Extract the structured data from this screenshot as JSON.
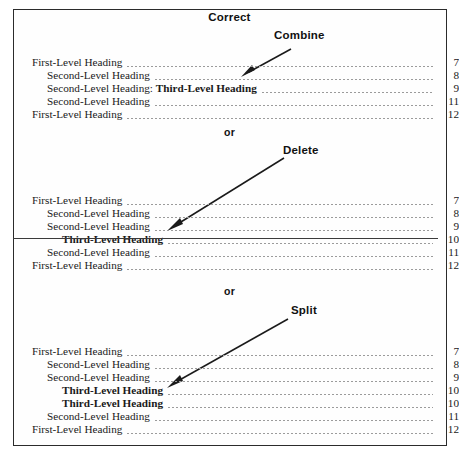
{
  "figure": {
    "caption_top": "Correct",
    "separator_label": "or",
    "border_color": "#2b2b2b"
  },
  "page_label_column_header": "",
  "blocks": [
    {
      "id": "combine",
      "action_label": "Combine",
      "rows": [
        {
          "level": 1,
          "title": "First-Level Heading",
          "page": "7",
          "bold": false,
          "struck": false
        },
        {
          "level": 2,
          "title": "Second-Level Heading",
          "page": "8",
          "bold": false,
          "struck": false
        },
        {
          "level": 2,
          "title": "Second-Level Heading: ",
          "title_bold_suffix": "Third-Level Heading",
          "page": "9",
          "bold": false,
          "struck": false
        },
        {
          "level": 2,
          "title": "Second-Level Heading",
          "page": "11",
          "bold": false,
          "struck": false
        },
        {
          "level": 1,
          "title": "First-Level Heading",
          "page": "12",
          "bold": false,
          "struck": false
        }
      ]
    },
    {
      "id": "delete",
      "action_label": "Delete",
      "rows": [
        {
          "level": 1,
          "title": "First-Level Heading",
          "page": "7",
          "bold": false,
          "struck": false
        },
        {
          "level": 2,
          "title": "Second-Level Heading",
          "page": "8",
          "bold": false,
          "struck": false
        },
        {
          "level": 2,
          "title": "Second-Level Heading",
          "page": "9",
          "bold": false,
          "struck": false
        },
        {
          "level": 3,
          "title": "Third-Level Heading",
          "page": "10",
          "bold": true,
          "struck": true
        },
        {
          "level": 2,
          "title": "Second-Level Heading",
          "page": "11",
          "bold": false,
          "struck": false
        },
        {
          "level": 1,
          "title": "First-Level Heading",
          "page": "12",
          "bold": false,
          "struck": false
        }
      ]
    },
    {
      "id": "split",
      "action_label": "Split",
      "rows": [
        {
          "level": 1,
          "title": "First-Level Heading",
          "page": "7",
          "bold": false,
          "struck": false
        },
        {
          "level": 2,
          "title": "Second-Level Heading",
          "page": "8",
          "bold": false,
          "struck": false
        },
        {
          "level": 2,
          "title": "Second-Level Heading",
          "page": "9",
          "bold": false,
          "struck": false
        },
        {
          "level": 3,
          "title": "Third-Level Heading",
          "page": "10",
          "bold": true,
          "struck": false
        },
        {
          "level": 3,
          "title": "Third-Level Heading",
          "page": "10",
          "bold": true,
          "struck": false
        },
        {
          "level": 2,
          "title": "Second-Level Heading",
          "page": "11",
          "bold": false,
          "struck": false
        },
        {
          "level": 1,
          "title": "First-Level Heading",
          "page": "12",
          "bold": false,
          "struck": false
        }
      ]
    }
  ],
  "annotations": {
    "arrow_combine": "annotation-arrow",
    "arrow_delete": "annotation-arrow",
    "arrow_split": "annotation-arrow"
  }
}
